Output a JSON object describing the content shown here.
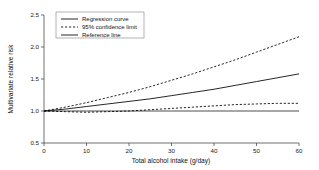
{
  "chart_data": {
    "type": "line",
    "title": "",
    "xlabel": "Total alcohol intake (g/day)",
    "ylabel": "Multivariate relative risk",
    "xlim": [
      0,
      60
    ],
    "ylim": [
      0.5,
      2.5
    ],
    "xticks": [
      "0",
      "10",
      "20",
      "30",
      "40",
      "50",
      "60"
    ],
    "xtick_values": [
      0,
      10,
      20,
      30,
      40,
      50,
      60
    ],
    "yticks": [
      "0.5",
      "1.0",
      "1.5",
      "2.0",
      "2.5"
    ],
    "ytick_values": [
      0.5,
      1.0,
      1.5,
      2.0,
      2.5
    ],
    "grid": false,
    "legend_position": "top-left",
    "x": [
      0,
      5,
      10,
      15,
      20,
      25,
      30,
      35,
      40,
      45,
      50,
      55,
      60
    ],
    "series": [
      {
        "name": "Regression curve",
        "style": "solid",
        "values": [
          1.0,
          1.03,
          1.07,
          1.11,
          1.15,
          1.19,
          1.24,
          1.29,
          1.34,
          1.4,
          1.46,
          1.52,
          1.58
        ]
      },
      {
        "name": "95% confidence limit",
        "style": "dashed",
        "role": "upper",
        "values": [
          1.0,
          1.06,
          1.13,
          1.21,
          1.29,
          1.38,
          1.48,
          1.58,
          1.69,
          1.8,
          1.92,
          2.04,
          2.16
        ]
      },
      {
        "name": "95% confidence limit",
        "style": "dashed",
        "role": "lower",
        "values": [
          1.0,
          0.99,
          0.98,
          0.99,
          1.0,
          1.02,
          1.04,
          1.06,
          1.08,
          1.1,
          1.11,
          1.12,
          1.12
        ]
      },
      {
        "name": "Reference line",
        "style": "solid",
        "role": "reference",
        "values": [
          1.0,
          1.0,
          1.0,
          1.0,
          1.0,
          1.0,
          1.0,
          1.0,
          1.0,
          1.0,
          1.0,
          1.0,
          1.0
        ]
      }
    ],
    "legend": [
      {
        "label": "Regression curve",
        "style": "solid"
      },
      {
        "label": "95% confidence limit",
        "style": "dashed"
      },
      {
        "label": "Reference line",
        "style": "solid"
      }
    ],
    "colors": {
      "line": "#000000",
      "axis": "#4d4d4d",
      "background": "#ffffff"
    }
  }
}
